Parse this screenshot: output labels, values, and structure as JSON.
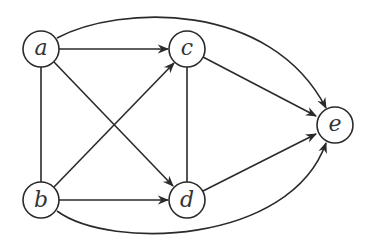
{
  "diagram": {
    "type": "directed-graph",
    "nodes": [
      {
        "id": "a",
        "label": "a",
        "x": 41,
        "y": 49
      },
      {
        "id": "b",
        "label": "b",
        "x": 41,
        "y": 200
      },
      {
        "id": "c",
        "label": "c",
        "x": 187,
        "y": 49
      },
      {
        "id": "d",
        "label": "d",
        "x": 187,
        "y": 200
      },
      {
        "id": "e",
        "label": "e",
        "x": 335,
        "y": 125
      }
    ],
    "edges": [
      {
        "from": "a",
        "to": "c",
        "directed": true
      },
      {
        "from": "a",
        "to": "d",
        "directed": true
      },
      {
        "from": "a",
        "to": "b",
        "directed": false
      },
      {
        "from": "a",
        "to": "e",
        "directed": true,
        "curved": true
      },
      {
        "from": "b",
        "to": "c",
        "directed": true
      },
      {
        "from": "b",
        "to": "d",
        "directed": true
      },
      {
        "from": "b",
        "to": "e",
        "directed": true,
        "curved": true
      },
      {
        "from": "c",
        "to": "d",
        "directed": false
      },
      {
        "from": "c",
        "to": "e",
        "directed": true
      },
      {
        "from": "d",
        "to": "e",
        "directed": true
      }
    ],
    "colors": {
      "stroke": "#2a2a2a",
      "background": "#ffffff",
      "label": "#333333"
    }
  }
}
